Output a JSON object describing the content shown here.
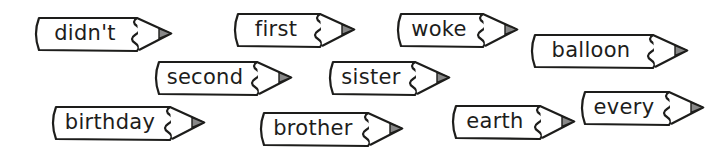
{
  "worksheet": {
    "words": [
      {
        "text": "didn't",
        "x": 33,
        "y": 17,
        "body": 104
      },
      {
        "text": "first",
        "x": 232,
        "y": 13,
        "body": 88
      },
      {
        "text": "woke",
        "x": 395,
        "y": 13,
        "body": 88
      },
      {
        "text": "balloon",
        "x": 529,
        "y": 34,
        "body": 124
      },
      {
        "text": "second",
        "x": 153,
        "y": 61,
        "body": 104
      },
      {
        "text": "sister",
        "x": 327,
        "y": 61,
        "body": 88
      },
      {
        "text": "birthday",
        "x": 50,
        "y": 106,
        "body": 120
      },
      {
        "text": "brother",
        "x": 258,
        "y": 112,
        "body": 110
      },
      {
        "text": "earth",
        "x": 450,
        "y": 105,
        "body": 90
      },
      {
        "text": "every",
        "x": 579,
        "y": 91,
        "body": 90
      }
    ],
    "colors": {
      "outline": "#1d1d1b",
      "fill": "#ffffff",
      "tip_shade": "#888888"
    }
  }
}
